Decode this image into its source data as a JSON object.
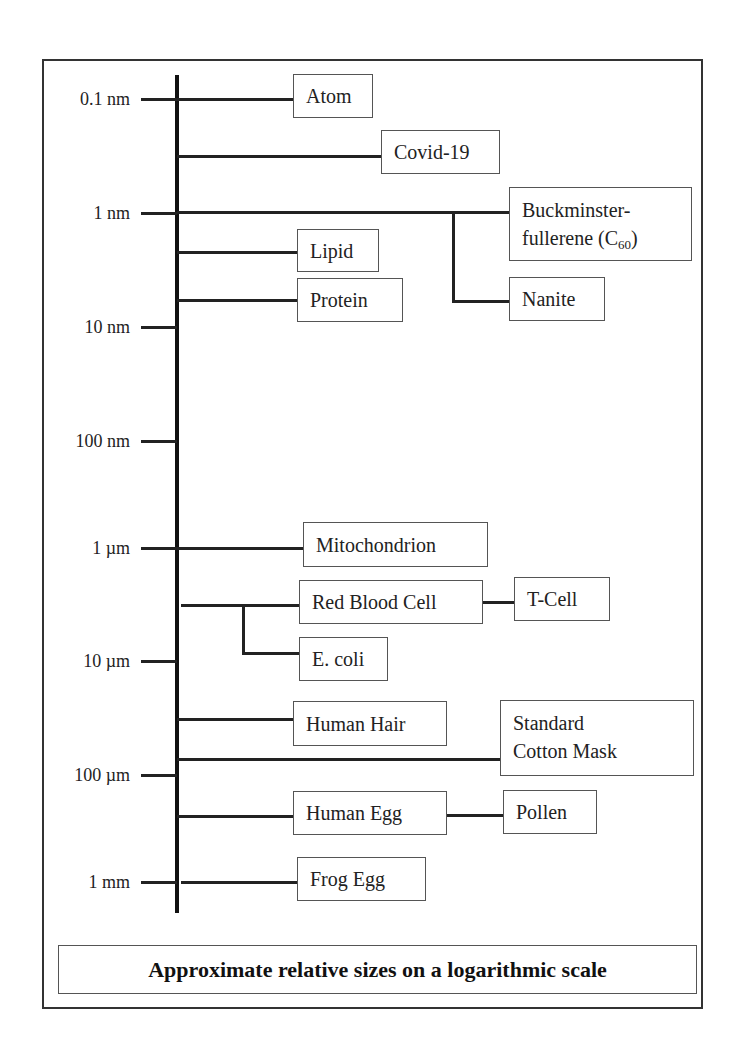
{
  "diagram": {
    "caption": "Approximate relative sizes on a logarithmic scale",
    "scale_ticks": [
      {
        "label": "0.1 nm"
      },
      {
        "label": "1 nm"
      },
      {
        "label": "10 nm"
      },
      {
        "label": "100 nm"
      },
      {
        "label": "1 µm"
      },
      {
        "label": "10 µm"
      },
      {
        "label": "100 µm"
      },
      {
        "label": "1 mm"
      }
    ],
    "items": {
      "atom": "Atom",
      "covid": "Covid-19",
      "buckminster_line1": "Buckminster-",
      "buckminster_line2": "fullerene (C",
      "buckminster_sub": "60",
      "buckminster_close": ")",
      "lipid": "Lipid",
      "protein": "Protein",
      "nanite": "Nanite",
      "mitochondrion": "Mitochondrion",
      "red_blood_cell": "Red Blood Cell",
      "t_cell": "T-Cell",
      "e_coli": "E. coli",
      "human_hair": "Human Hair",
      "mask_line1": "Standard",
      "mask_line2": "Cotton Mask",
      "human_egg": "Human Egg",
      "pollen": "Pollen",
      "frog_egg": "Frog Egg"
    },
    "colors": {
      "line": "#222222",
      "border": "#555555",
      "background": "#ffffff"
    }
  }
}
